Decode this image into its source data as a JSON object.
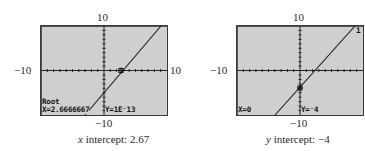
{
  "graphs": [
    {
      "id": "root",
      "axis_labels": {
        "top": "10",
        "bottom": "−10",
        "left": "−10",
        "right": "10"
      },
      "window": {
        "xmin": -10,
        "xmax": 10,
        "ymin": -10,
        "ymax": 10
      },
      "function": "y = 1.5x - 4",
      "screen_text": {
        "mode": "Root",
        "x_readout": "X=2.6666667",
        "y_readout": "Y=1E⁻13"
      },
      "caption": {
        "variable": "x",
        "text": " intercept:  2.67"
      }
    },
    {
      "id": "yint",
      "axis_labels": {
        "top": "10",
        "bottom": "−10",
        "left": "−10"
      },
      "window": {
        "xmin": -10,
        "xmax": 10,
        "ymin": -10,
        "ymax": 10
      },
      "function": "y = 1.5x - 4",
      "screen_text": {
        "x_readout": "X=0",
        "y_readout": "Y=⁻4",
        "graph_number": "1"
      },
      "caption": {
        "variable": "y",
        "text": " intercept:  −4"
      }
    }
  ]
}
